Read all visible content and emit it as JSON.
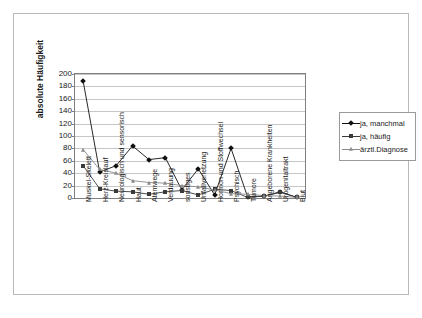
{
  "chart_data": {
    "type": "line",
    "title": "",
    "xlabel": "",
    "ylabel": "absolute Häufigkeit",
    "ylim": [
      0,
      200
    ],
    "ytick_step": 20,
    "yticks": [
      0,
      20,
      40,
      60,
      80,
      100,
      120,
      140,
      160,
      180,
      200
    ],
    "grid": true,
    "legend_position": "right",
    "categories": [
      "Muskel-Skelett",
      "Herz-Kreislauf",
      "Neurologisch und sensorisch",
      "Haut",
      "Atemwege",
      "Verdauung",
      "sonstiges",
      "Unfallverletzung",
      "Hormon und Stoffwechsel",
      "Psychisch",
      "Tumore",
      "Angeborene Krankheiten",
      "Urogenitaltrakt",
      "Blut"
    ],
    "series": [
      {
        "name": "ja, manchmal",
        "marker": "diamond",
        "color": "#101010",
        "values": [
          188,
          42,
          52,
          84,
          62,
          65,
          13,
          47,
          5,
          80,
          2,
          3,
          10,
          1
        ]
      },
      {
        "name": "ja, häufig",
        "marker": "square",
        "color": "#3a3a3a",
        "values": [
          52,
          15,
          11,
          10,
          6,
          10,
          12,
          5,
          14,
          12,
          1,
          3,
          9,
          1
        ]
      },
      {
        "name": "ärztl.Diagnose",
        "marker": "triangle",
        "color": "#8a8a8a",
        "values": [
          78,
          46,
          40,
          28,
          25,
          24,
          20,
          18,
          13,
          7,
          6,
          4,
          3,
          1
        ]
      }
    ]
  },
  "legend": {
    "items": [
      {
        "label": "ja, manchmal"
      },
      {
        "label": "ja, häufig"
      },
      {
        "label": "ärztl.Diagnose"
      }
    ]
  },
  "axis": {
    "y_title": "absolute Häufigkeit",
    "y_tick_labels": [
      "200",
      "180",
      "160",
      "140",
      "120",
      "100",
      "80",
      "60",
      "40",
      "20",
      "0"
    ]
  }
}
